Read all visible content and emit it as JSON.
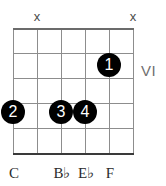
{
  "diagram": {
    "type": "guitar-chord-diagram",
    "position_marker": "VI",
    "string_count": 6,
    "fret_count": 5,
    "colors": {
      "grid": "#8d8d8d",
      "dot": "#000000",
      "dot_text": "#ffffff",
      "label": "#2b2b2b",
      "position": "#6f6f6f",
      "mute": "#4a4a4a",
      "background": "#ffffff"
    }
  },
  "mute_markers": [
    {
      "symbol": "x",
      "string": 2,
      "x": 29,
      "y": 9
    },
    {
      "symbol": "x",
      "string": 6,
      "x": 125,
      "y": 9
    }
  ],
  "strings": [
    {
      "index": 1,
      "x": 13
    },
    {
      "index": 2,
      "x": 37
    },
    {
      "index": 3,
      "x": 61
    },
    {
      "index": 4,
      "x": 85
    },
    {
      "index": 5,
      "x": 109
    },
    {
      "index": 6,
      "x": 133
    }
  ],
  "frets": [
    {
      "index": 0,
      "y": 28,
      "nut": true
    },
    {
      "index": 1,
      "y": 53,
      "nut": false
    },
    {
      "index": 2,
      "y": 78,
      "nut": false
    },
    {
      "index": 3,
      "y": 103,
      "nut": false
    },
    {
      "index": 4,
      "y": 128,
      "nut": false
    },
    {
      "index": 5,
      "y": 153,
      "nut": false
    }
  ],
  "finger_dots": [
    {
      "finger": "1",
      "string": 5,
      "fret": 2,
      "x": 97,
      "y": 53
    },
    {
      "finger": "2",
      "string": 1,
      "fret": 4,
      "x": 1,
      "y": 100
    },
    {
      "finger": "3",
      "string": 3,
      "fret": 4,
      "x": 49,
      "y": 100
    },
    {
      "finger": "4",
      "string": 4,
      "fret": 4,
      "x": 73,
      "y": 100
    }
  ],
  "note_labels": [
    {
      "note": "C",
      "string": 1,
      "x": 1,
      "y": 164
    },
    {
      "note": "B♭",
      "string": 3,
      "x": 49,
      "y": 164
    },
    {
      "note": "E♭",
      "string": 4,
      "x": 73,
      "y": 164
    },
    {
      "note": "F",
      "string": 5,
      "x": 97,
      "y": 164
    }
  ],
  "position": {
    "label": "VI",
    "x": 141,
    "y": 62
  }
}
